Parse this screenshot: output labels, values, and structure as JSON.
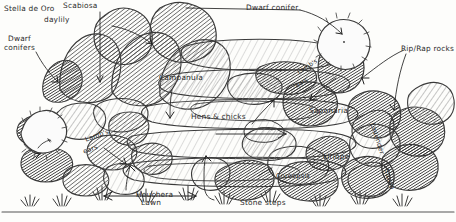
{
  "drawing": {
    "title": "Hand-drawn retaining wall garden planting plan",
    "medium": "pencil sketch",
    "ink_color": "#2a2a2a",
    "paper_color": "#fdfdfb"
  },
  "labels": {
    "stella_de_oro": "Stella de Oro",
    "daylily": "daylily",
    "scabiosa": "Scabiosa",
    "dwarf_conifers": "Dwarf",
    "dwarf_conifers2": "conifers",
    "dwarf_conifer_top": "Dwarf conifer",
    "rip_rap": "Rip/Rap rocks",
    "campanula": "Campanula",
    "hens_chicks": "Hens & chicks",
    "saponaria": "Saponaria",
    "lambs_ears_right_a": "Lamb's",
    "lambs_ears_right_b": "ears",
    "lambs_ears_left_a": "Lamb's",
    "lambs_ears_left_b": "ears",
    "liriope": "Liriope",
    "coreopsis": "Coreopsis",
    "lavender": "Lavender",
    "salvia": "Salvia",
    "heuchera": "Heuchera",
    "lawn": "Lawn",
    "stone_steps": "Stone steps"
  },
  "plant_list": [
    "Stella de Oro daylily",
    "Scabiosa",
    "Dwarf conifers",
    "Dwarf conifer",
    "Campanula",
    "Hens & chicks",
    "Saponaria",
    "Lamb's ears",
    "Liriope",
    "Coreopsis",
    "Lavender",
    "Salvia",
    "Heuchera"
  ],
  "hardscape_list": [
    "Rip/Rap rocks",
    "Stone steps",
    "Lawn"
  ]
}
